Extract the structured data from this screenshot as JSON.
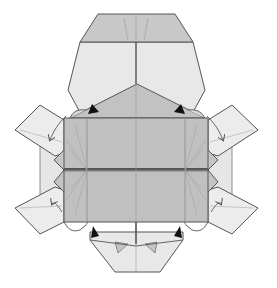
{
  "diagram": {
    "title": "",
    "canvas": {
      "width": 277,
      "height": 288,
      "background": "#ffffff"
    },
    "colors": {
      "light_paper": "#e9e9e9",
      "medium_paper": "#c9c9c9",
      "dark_paper": "#b9b9b9",
      "outline": "#555555",
      "crease": "#8a8a8a",
      "arrow_fill": "#111111",
      "valley_arrow": "#555555"
    },
    "parts": {
      "head_tip": {
        "label": "head-tip",
        "points": "98,14 175,14 193,42 80,42"
      },
      "head": {
        "label": "head",
        "points": "80,42 193,42 205,90 190,118 83,118 68,90"
      },
      "head_triangle": {
        "label": "head-triangle-flap",
        "points": "70,118 137,84 205,118"
      },
      "shell_upper": {
        "label": "shell-upper",
        "points": "64,118 208,118 208,170 64,170"
      },
      "shell_lower": {
        "label": "shell-lower",
        "points": "64,170 208,170 208,222 64,222"
      },
      "tail": {
        "label": "tail",
        "points": "90,232 183,232 183,240 160,272 115,272 90,240"
      },
      "front_left_flipper": {
        "label": "front-left-flipper",
        "points": "15,130 40,105 64,120 64,153 55,156"
      },
      "front_right_flipper": {
        "label": "front-right-flipper",
        "points": "208,120 232,105 258,130 218,156 208,153"
      },
      "rear_left_flipper": {
        "label": "rear-left-flipper",
        "points": "15,208 55,187 64,190 64,222 40,234"
      },
      "rear_right_flipper": {
        "label": "rear-right-flipper",
        "points": "208,190 218,187 258,208 232,234 208,222"
      },
      "left_side_strip": {
        "label": "left-side-strip",
        "points": "40,140 64,140 64,205 40,205"
      },
      "right_side_strip": {
        "label": "right-side-strip",
        "points": "208,140 232,140 232,205 208,205"
      }
    },
    "arrows": [
      {
        "name": "push-arrow-upper-left",
        "type": "filled",
        "x": 93,
        "y": 110,
        "angle": 140
      },
      {
        "name": "push-arrow-upper-right",
        "type": "filled",
        "x": 180,
        "y": 110,
        "angle": 40
      },
      {
        "name": "push-arrow-lower-left",
        "type": "filled",
        "x": 95,
        "y": 234,
        "angle": 220
      },
      {
        "name": "push-arrow-lower-right",
        "type": "filled",
        "x": 178,
        "y": 234,
        "angle": -40
      }
    ],
    "fold_arrows": [
      {
        "name": "fold-arrow-front-left",
        "d": "M72,114 C62,124 56,132 52,140",
        "head": "52,140"
      },
      {
        "name": "fold-arrow-front-right",
        "d": "M201,114 C211,124 217,132 221,140",
        "head": "221,140"
      },
      {
        "name": "fold-arrow-rear-left",
        "d": "M66,212 C60,204 56,198 52,204",
        "head": "52,204"
      },
      {
        "name": "fold-arrow-rear-right",
        "d": "M207,212 C213,204 217,198 221,204",
        "head": "221,204"
      }
    ]
  }
}
